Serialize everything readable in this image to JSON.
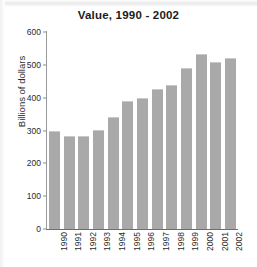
{
  "chart_data": {
    "type": "bar",
    "title": "Value, 1990 - 2002",
    "xlabel": "",
    "ylabel": "Billions of dollars",
    "categories": [
      "1990",
      "1991",
      "1992",
      "1993",
      "1994",
      "1995",
      "1996",
      "1997",
      "1998",
      "1999",
      "2000",
      "2001",
      "2002"
    ],
    "values": [
      298,
      283,
      282,
      303,
      342,
      390,
      400,
      427,
      439,
      491,
      534,
      510,
      521
    ],
    "ylim": [
      0,
      600
    ],
    "yticks": [
      0,
      100,
      200,
      300,
      400,
      500,
      600
    ],
    "ytick_labels": [
      "0",
      "100",
      "200",
      "300",
      "400",
      "500",
      "600"
    ],
    "grid": false,
    "legend": null,
    "bar_color": "#a9a9a9",
    "axis_color": "#8d8d8d",
    "text_color": "#2b2b2b",
    "background": "#ffffff"
  }
}
